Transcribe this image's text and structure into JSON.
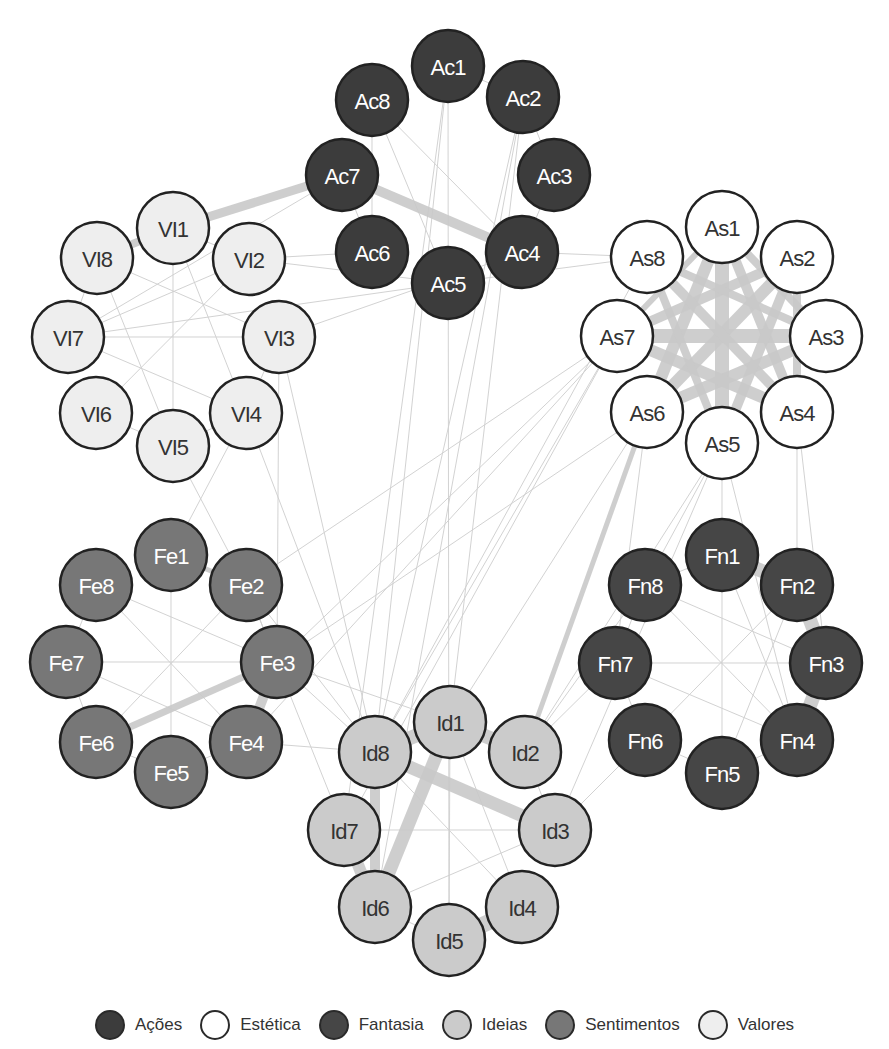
{
  "chart_data": {
    "type": "network",
    "title": "",
    "groups": [
      {
        "id": "Ac",
        "name": "Ações",
        "fill": "#3c3c3c",
        "text": "#ffffff",
        "center": [
          448,
          175
        ],
        "ring_radius": 109,
        "start_angle": -90
      },
      {
        "id": "As",
        "name": "Estética",
        "fill": "#ffffff",
        "text": "#333333",
        "center": [
          722,
          336
        ],
        "ring_radius": 110,
        "start_angle": -90
      },
      {
        "id": "Fn",
        "name": "Fantasia",
        "fill": "#464646",
        "text": "#ffffff",
        "center": [
          722,
          663
        ],
        "ring_radius": 111,
        "start_angle": -90
      },
      {
        "id": "Id",
        "name": "Ideias",
        "fill": "#cbcbcb",
        "text": "#333333",
        "center": [
          452,
          828
        ],
        "ring_radius": 110,
        "start_angle": -90
      },
      {
        "id": "Fe",
        "name": "Sentimentos",
        "fill": "#777777",
        "text": "#ffffff",
        "center": [
          170,
          662
        ],
        "ring_radius": 108,
        "start_angle": -90
      },
      {
        "id": "Vl",
        "name": "Valores",
        "fill": "#eeeeee",
        "text": "#333333",
        "center": [
          173,
          340
        ],
        "ring_radius": 108,
        "start_angle": -90
      }
    ],
    "nodes": [
      {
        "id": "Ac1",
        "label": "Ac1",
        "group": "Ac",
        "x": 448,
        "y": 66
      },
      {
        "id": "Ac2",
        "label": "Ac2",
        "group": "Ac",
        "x": 523,
        "y": 97
      },
      {
        "id": "Ac3",
        "label": "Ac3",
        "group": "Ac",
        "x": 554,
        "y": 175
      },
      {
        "id": "Ac4",
        "label": "Ac4",
        "group": "Ac",
        "x": 522,
        "y": 252
      },
      {
        "id": "Ac5",
        "label": "Ac5",
        "group": "Ac",
        "x": 448,
        "y": 283
      },
      {
        "id": "Ac6",
        "label": "Ac6",
        "group": "Ac",
        "x": 372,
        "y": 252
      },
      {
        "id": "Ac7",
        "label": "Ac7",
        "group": "Ac",
        "x": 342,
        "y": 175
      },
      {
        "id": "Ac8",
        "label": "Ac8",
        "group": "Ac",
        "x": 372,
        "y": 100
      },
      {
        "id": "As1",
        "label": "As1",
        "group": "As",
        "x": 722,
        "y": 227
      },
      {
        "id": "As2",
        "label": "As2",
        "group": "As",
        "x": 797,
        "y": 257
      },
      {
        "id": "As3",
        "label": "As3",
        "group": "As",
        "x": 826,
        "y": 336
      },
      {
        "id": "As4",
        "label": "As4",
        "group": "As",
        "x": 797,
        "y": 412
      },
      {
        "id": "As5",
        "label": "As5",
        "group": "As",
        "x": 722,
        "y": 443
      },
      {
        "id": "As6",
        "label": "As6",
        "group": "As",
        "x": 647,
        "y": 412
      },
      {
        "id": "As7",
        "label": "As7",
        "group": "As",
        "x": 617,
        "y": 336
      },
      {
        "id": "As8",
        "label": "As8",
        "group": "As",
        "x": 647,
        "y": 257
      },
      {
        "id": "Fn1",
        "label": "Fn1",
        "group": "Fn",
        "x": 722,
        "y": 555
      },
      {
        "id": "Fn2",
        "label": "Fn2",
        "group": "Fn",
        "x": 797,
        "y": 585
      },
      {
        "id": "Fn3",
        "label": "Fn3",
        "group": "Fn",
        "x": 826,
        "y": 663
      },
      {
        "id": "Fn4",
        "label": "Fn4",
        "group": "Fn",
        "x": 797,
        "y": 740
      },
      {
        "id": "Fn5",
        "label": "Fn5",
        "group": "Fn",
        "x": 722,
        "y": 773
      },
      {
        "id": "Fn6",
        "label": "Fn6",
        "group": "Fn",
        "x": 645,
        "y": 740
      },
      {
        "id": "Fn7",
        "label": "Fn7",
        "group": "Fn",
        "x": 615,
        "y": 663
      },
      {
        "id": "Fn8",
        "label": "Fn8",
        "group": "Fn",
        "x": 645,
        "y": 585
      },
      {
        "id": "Id1",
        "label": "Id1",
        "group": "Id",
        "x": 450,
        "y": 722
      },
      {
        "id": "Id2",
        "label": "Id2",
        "group": "Id",
        "x": 525,
        "y": 752
      },
      {
        "id": "Id3",
        "label": "Id3",
        "group": "Id",
        "x": 555,
        "y": 830
      },
      {
        "id": "Id4",
        "label": "Id4",
        "group": "Id",
        "x": 522,
        "y": 907
      },
      {
        "id": "Id5",
        "label": "Id5",
        "group": "Id",
        "x": 449,
        "y": 940
      },
      {
        "id": "Id6",
        "label": "Id6",
        "group": "Id",
        "x": 375,
        "y": 907
      },
      {
        "id": "Id7",
        "label": "Id7",
        "group": "Id",
        "x": 344,
        "y": 830
      },
      {
        "id": "Id8",
        "label": "Id8",
        "group": "Id",
        "x": 375,
        "y": 752
      },
      {
        "id": "Fe1",
        "label": "Fe1",
        "group": "Fe",
        "x": 171,
        "y": 555
      },
      {
        "id": "Fe2",
        "label": "Fe2",
        "group": "Fe",
        "x": 246,
        "y": 585
      },
      {
        "id": "Fe3",
        "label": "Fe3",
        "group": "Fe",
        "x": 277,
        "y": 662
      },
      {
        "id": "Fe4",
        "label": "Fe4",
        "group": "Fe",
        "x": 246,
        "y": 742
      },
      {
        "id": "Fe5",
        "label": "Fe5",
        "group": "Fe",
        "x": 171,
        "y": 772
      },
      {
        "id": "Fe6",
        "label": "Fe6",
        "group": "Fe",
        "x": 96,
        "y": 742
      },
      {
        "id": "Fe7",
        "label": "Fe7",
        "group": "Fe",
        "x": 66,
        "y": 662
      },
      {
        "id": "Fe8",
        "label": "Fe8",
        "group": "Fe",
        "x": 96,
        "y": 585
      },
      {
        "id": "Vl1",
        "label": "VI1",
        "group": "Vl",
        "x": 173,
        "y": 228
      },
      {
        "id": "Vl2",
        "label": "VI2",
        "group": "Vl",
        "x": 249,
        "y": 259
      },
      {
        "id": "Vl3",
        "label": "VI3",
        "group": "Vl",
        "x": 279,
        "y": 337
      },
      {
        "id": "Vl4",
        "label": "VI4",
        "group": "Vl",
        "x": 246,
        "y": 413
      },
      {
        "id": "Vl5",
        "label": "VI5",
        "group": "Vl",
        "x": 173,
        "y": 446
      },
      {
        "id": "Vl6",
        "label": "VI6",
        "group": "Vl",
        "x": 96,
        "y": 413
      },
      {
        "id": "Vl7",
        "label": "VI7",
        "group": "Vl",
        "x": 68,
        "y": 337
      },
      {
        "id": "Vl8",
        "label": "VI8",
        "group": "Vl",
        "x": 97,
        "y": 258
      }
    ],
    "edges_thick": [
      [
        "Vl8",
        "Vl1",
        8
      ],
      [
        "Vl1",
        "Ac7",
        9
      ],
      [
        "Ac7",
        "Ac4",
        10
      ],
      [
        "As1",
        "As5",
        14
      ],
      [
        "As1",
        "As6",
        12
      ],
      [
        "As1",
        "As4",
        10
      ],
      [
        "As2",
        "As6",
        12
      ],
      [
        "As2",
        "As7",
        10
      ],
      [
        "As3",
        "As7",
        14
      ],
      [
        "As3",
        "As6",
        12
      ],
      [
        "As8",
        "As4",
        10
      ],
      [
        "As8",
        "As3",
        8
      ],
      [
        "As2",
        "As5",
        10
      ],
      [
        "As1",
        "As3",
        8
      ],
      [
        "As7",
        "As4",
        12
      ],
      [
        "As2",
        "As4",
        8
      ],
      [
        "As1",
        "As7",
        6
      ],
      [
        "As8",
        "As5",
        8
      ],
      [
        "As6",
        "Id2",
        5
      ],
      [
        "Fn1",
        "Fn2",
        14
      ],
      [
        "Fn2",
        "Fn3",
        14
      ],
      [
        "Fn3",
        "Fn4",
        14
      ],
      [
        "Fe3",
        "Fe6",
        7
      ],
      [
        "Fe3",
        "Fe4",
        10
      ],
      [
        "Fe1",
        "Fe2",
        5
      ],
      [
        "Id8",
        "Id1",
        14
      ],
      [
        "Id1",
        "Id2",
        14
      ],
      [
        "Id8",
        "Id3",
        13
      ],
      [
        "Id1",
        "Id6",
        13
      ],
      [
        "Id8",
        "Id6",
        10
      ],
      [
        "Id7",
        "Id6",
        12
      ],
      [
        "Id5",
        "Id4",
        16
      ]
    ],
    "edges_thin": [
      [
        "Ac1",
        "Id5"
      ],
      [
        "Ac1",
        "Id7"
      ],
      [
        "Ac1",
        "Id8"
      ],
      [
        "Ac2",
        "Id6"
      ],
      [
        "Ac2",
        "Id1"
      ],
      [
        "Ac2",
        "Id8"
      ],
      [
        "Ac8",
        "Ac4"
      ],
      [
        "Ac8",
        "Ac5"
      ],
      [
        "Ac8",
        "Ac6"
      ],
      [
        "Ac1",
        "Ac2"
      ],
      [
        "Ac2",
        "Ac3"
      ],
      [
        "Ac7",
        "Ac6"
      ],
      [
        "Ac3",
        "Ac4"
      ],
      [
        "Ac6",
        "Vl2"
      ],
      [
        "Ac5",
        "Vl2"
      ],
      [
        "Ac4",
        "Vl3"
      ],
      [
        "Ac4",
        "As8"
      ],
      [
        "Ac5",
        "As8"
      ],
      [
        "Ac5",
        "Vl7"
      ],
      [
        "Ac7",
        "Vl7"
      ],
      [
        "Vl1",
        "Vl5"
      ],
      [
        "Vl1",
        "Vl4"
      ],
      [
        "Vl2",
        "Vl6"
      ],
      [
        "Vl2",
        "Vl7"
      ],
      [
        "Vl8",
        "Vl3"
      ],
      [
        "Vl8",
        "Vl5"
      ],
      [
        "Vl7",
        "Vl3"
      ],
      [
        "Vl7",
        "Vl4"
      ],
      [
        "Vl6",
        "Vl5"
      ],
      [
        "Vl5",
        "Vl4"
      ],
      [
        "Vl3",
        "Vl4"
      ],
      [
        "Vl7",
        "Vl8"
      ],
      [
        "Vl1",
        "Vl2"
      ],
      [
        "Vl4",
        "Id8"
      ],
      [
        "Vl3",
        "Id8"
      ],
      [
        "Vl5",
        "Fe2"
      ],
      [
        "Vl4",
        "Fe1"
      ],
      [
        "Vl3",
        "Fe3"
      ],
      [
        "Fe8",
        "Fe3"
      ],
      [
        "Fe8",
        "Fe4"
      ],
      [
        "Fe7",
        "Fe3"
      ],
      [
        "Fe7",
        "Fe4"
      ],
      [
        "Fe1",
        "Fe5"
      ],
      [
        "Fe2",
        "Fe6"
      ],
      [
        "Fe8",
        "Fe7"
      ],
      [
        "Fe7",
        "Fe6"
      ],
      [
        "Fe6",
        "Fe5"
      ],
      [
        "Fe5",
        "Fe4"
      ],
      [
        "Fe2",
        "Fe3"
      ],
      [
        "Fe2",
        "As7"
      ],
      [
        "Fe3",
        "As7"
      ],
      [
        "Fe3",
        "As6"
      ],
      [
        "Fe4",
        "As7"
      ],
      [
        "Fe2",
        "Id8"
      ],
      [
        "Fe3",
        "Id8"
      ],
      [
        "Fe3",
        "Id1"
      ],
      [
        "Fe4",
        "Id8"
      ],
      [
        "Fe2",
        "Id6"
      ],
      [
        "As7",
        "Id8"
      ],
      [
        "As7",
        "Id7"
      ],
      [
        "As8",
        "Id8"
      ],
      [
        "As6",
        "Id1"
      ],
      [
        "As5",
        "Id2"
      ],
      [
        "As5",
        "Id3"
      ],
      [
        "As5",
        "Fn8"
      ],
      [
        "As5",
        "Fn1"
      ],
      [
        "As4",
        "Fn2"
      ],
      [
        "As6",
        "Fn7"
      ],
      [
        "As5",
        "Fn4"
      ],
      [
        "As4",
        "Fn3"
      ],
      [
        "Fn1",
        "Fn4"
      ],
      [
        "Fn1",
        "Fn5"
      ],
      [
        "Fn8",
        "Fn3"
      ],
      [
        "Fn8",
        "Fn4"
      ],
      [
        "Fn7",
        "Fn3"
      ],
      [
        "Fn7",
        "Fn4"
      ],
      [
        "Fn2",
        "Fn5"
      ],
      [
        "Fn2",
        "Fn6"
      ],
      [
        "Fn8",
        "Fn1"
      ],
      [
        "Fn6",
        "Fn5"
      ],
      [
        "Fn5",
        "Fn4"
      ],
      [
        "Fn7",
        "Fn6"
      ],
      [
        "Fn8",
        "Fn7"
      ],
      [
        "Fn7",
        "Id2"
      ],
      [
        "Fn8",
        "Id2"
      ],
      [
        "Fn6",
        "Id3"
      ],
      [
        "Id1",
        "Id5"
      ],
      [
        "Id1",
        "Id4"
      ],
      [
        "Id7",
        "Id3"
      ],
      [
        "Id6",
        "Id3"
      ],
      [
        "Id6",
        "Id5"
      ],
      [
        "Id2",
        "Id3"
      ],
      [
        "Id8",
        "Id4"
      ]
    ],
    "node_radius": 36,
    "edge_color": "#c9c9c9",
    "thin_edge_color": "#d0d0d0"
  },
  "legend": {
    "items": [
      {
        "label": "Ações",
        "fill": "#3c3c3c"
      },
      {
        "label": "Estética",
        "fill": "#ffffff"
      },
      {
        "label": "Fantasia",
        "fill": "#464646"
      },
      {
        "label": "Ideias",
        "fill": "#cbcbcb"
      },
      {
        "label": "Sentimentos",
        "fill": "#777777"
      },
      {
        "label": "Valores",
        "fill": "#eeeeee"
      }
    ]
  }
}
